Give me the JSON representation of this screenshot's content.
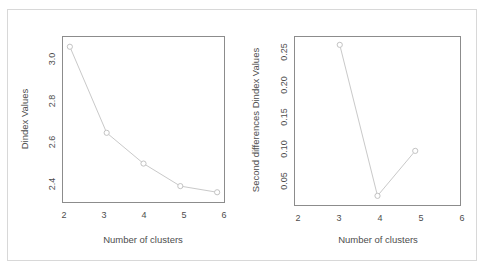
{
  "figure": {
    "background_color": "#ffffff",
    "frame_color": "#d8d8d8",
    "axis_color": "#8c8c8c",
    "series_color": "#c9c9c9"
  },
  "chart_data": [
    {
      "type": "line",
      "panel": "left",
      "title": "",
      "xlabel": "Number of clusters",
      "ylabel": "Dindex Values",
      "x": [
        2,
        3,
        4,
        5,
        6
      ],
      "values": [
        3.12,
        2.7,
        2.55,
        2.44,
        2.41
      ],
      "xticks": [
        2,
        3,
        4,
        5,
        6
      ],
      "xtick_labels": [
        "2",
        "3",
        "4",
        "5",
        "6"
      ],
      "yticks": [
        2.4,
        2.6,
        2.8,
        3.0
      ],
      "ytick_labels": [
        "2.4",
        "2.6",
        "2.8",
        "3.0"
      ],
      "xlim": [
        1.8,
        6.2
      ],
      "ylim": [
        2.36,
        3.17
      ],
      "grid": false,
      "legend": "none",
      "marker": "open-circle"
    },
    {
      "type": "line",
      "panel": "right",
      "title": "",
      "xlabel": "Number of clusters",
      "ylabel": "Second differences Dindex Values",
      "x": [
        3,
        4,
        5
      ],
      "values": [
        0.255,
        0.02,
        0.09
      ],
      "xticks": [
        2,
        3,
        4,
        5,
        6
      ],
      "xtick_labels": [
        "2",
        "3",
        "4",
        "5",
        "6"
      ],
      "yticks": [
        0.05,
        0.1,
        0.15,
        0.2,
        0.25
      ],
      "ytick_labels": [
        "0.05",
        "0.10",
        "0.15",
        "0.20",
        "0.25"
      ],
      "xlim": [
        1.8,
        6.2
      ],
      "ylim": [
        0.005,
        0.268
      ],
      "grid": false,
      "legend": "none",
      "marker": "open-circle"
    }
  ]
}
